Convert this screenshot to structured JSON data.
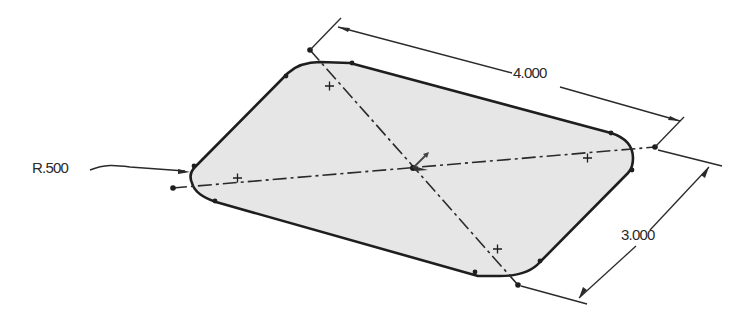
{
  "drawing": {
    "type": "isometric sketch of rounded rectangle",
    "colors": {
      "background": "#ffffff",
      "fill": "#e8e8e8",
      "outline": "#1e1e1e",
      "dimension_line": "#2a2a2a",
      "text": "#2a2a2a"
    },
    "dimensions": {
      "length": "4.000",
      "width": "3.000",
      "radius": "R.500"
    },
    "centerlines": [
      "horizontal-centerline",
      "diagonal-centerline"
    ],
    "markers": [
      "origin-point",
      "arc-center-left",
      "arc-center-right",
      "arc-center-top",
      "arc-center-bottom"
    ]
  }
}
